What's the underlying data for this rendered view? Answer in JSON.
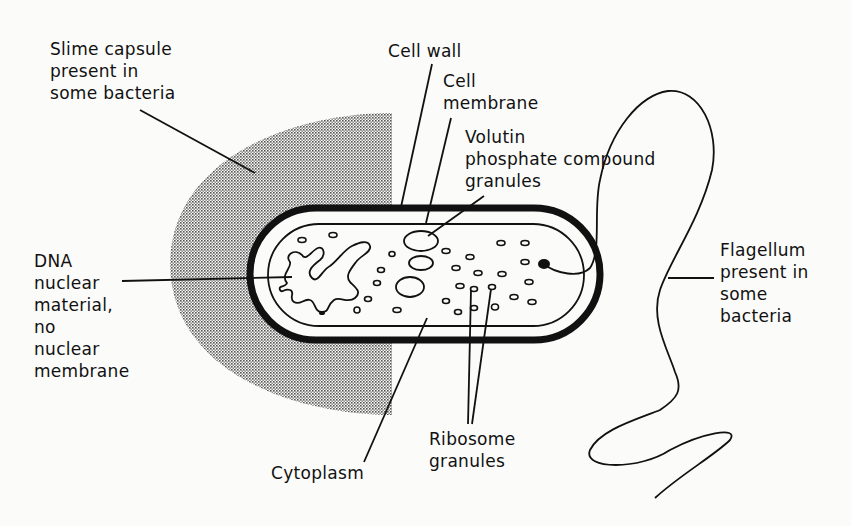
{
  "labels": {
    "slime_capsule": "Slime capsule\npresent in\nsome bacteria",
    "cell_wall": "Cell wall",
    "cell_membrane": "Cell\nmembrane",
    "volutin": "Volutin\nphosphate compound\ngranules",
    "dna": "DNA\nnuclear\nmaterial,\nno\nnuclear\nmembrane",
    "flagellum": "Flagellum\npresent in\nsome\nbacteria",
    "cytoplasm": "Cytoplasm",
    "ribosome": "Ribosome\ngranules"
  },
  "colors": {
    "ink": "#111111",
    "background": "#fbfbfa",
    "capsule_shade": "#9a9a9a"
  }
}
